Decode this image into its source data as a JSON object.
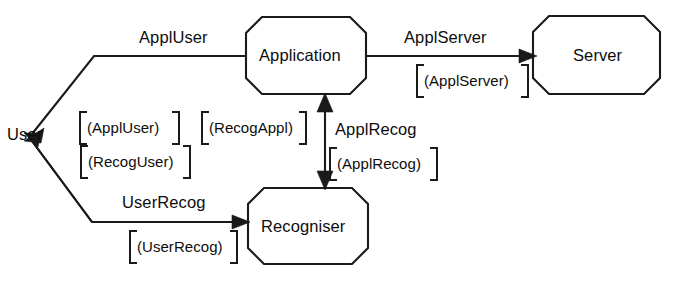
{
  "diagram": {
    "background_color": "#ffffff",
    "line_color": "#1a1a1a",
    "nodes": [
      {
        "id": "user",
        "label": "User",
        "shape": "text-only"
      },
      {
        "id": "application",
        "label": "Application",
        "shape": "octagon"
      },
      {
        "id": "recogniser",
        "label": "Recogniser",
        "shape": "octagon"
      },
      {
        "id": "server",
        "label": "Server",
        "shape": "octagon"
      }
    ],
    "edges": [
      {
        "id": "appl-user",
        "from": "application",
        "to": "user",
        "label": "ApplUser",
        "interface": "[(ApplUser)]",
        "arrow": "single"
      },
      {
        "id": "recog-user",
        "from": "recogniser",
        "to": "user",
        "label": "",
        "interface": "[(RecogUser)]",
        "arrow": "single"
      },
      {
        "id": "user-recog",
        "from": "user",
        "to": "recogniser",
        "label": "UserRecog",
        "interface": "[(UserRecog)]",
        "arrow": "single"
      },
      {
        "id": "recog-appl",
        "from": "recogniser",
        "to": "application",
        "label": "",
        "interface": "[(RecogAppl)]",
        "arrow": "single"
      },
      {
        "id": "appl-recog",
        "from": "application",
        "to": "recogniser",
        "label": "ApplRecog",
        "interface": "[(ApplRecog)]",
        "arrow": "double"
      },
      {
        "id": "appl-server",
        "from": "application",
        "to": "server",
        "label": "ApplServer",
        "interface": "[(ApplServer)]",
        "arrow": "single"
      }
    ],
    "labels": {
      "user": "User",
      "application": "Application",
      "recogniser": "Recogniser",
      "server": "Server",
      "appl_user": "ApplUser",
      "appl_server": "ApplServer",
      "appl_recog": "ApplRecog",
      "user_recog": "UserRecog",
      "iface_appl_user": "(ApplUser)",
      "iface_recog_user": "(RecogUser)",
      "iface_recog_appl": "(RecogAppl)",
      "iface_appl_recog": "(ApplRecog)",
      "iface_user_recog": "(UserRecog)",
      "iface_appl_server": "(ApplServer)"
    }
  }
}
